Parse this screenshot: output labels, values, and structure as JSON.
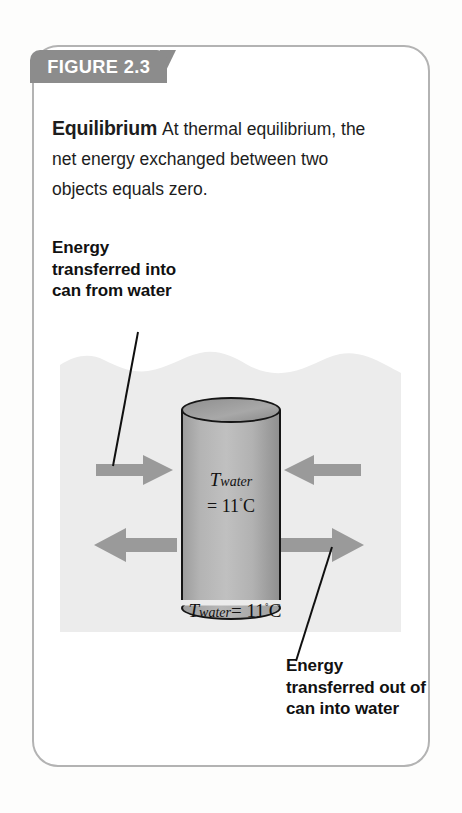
{
  "figure": {
    "tab_label": "FIGURE 2.3",
    "caption_lead": "Equilibrium",
    "caption_body": "At thermal equilibrium, the net energy exchanged between two objects equals zero."
  },
  "callouts": {
    "into_can": "Energy transferred into can from water",
    "out_of_can": "Energy transferred out of can into water"
  },
  "diagram": {
    "can_temperature_symbol": "T",
    "can_temperature_subscript": "water",
    "can_temperature_value": "= 11",
    "degree_symbol": "˚",
    "unit": "C",
    "below_can_label_symbol": "T",
    "below_can_label_subscript": "water",
    "below_can_label_value": "= 11",
    "below_can_label_unit": "C"
  },
  "colors": {
    "tab_gray": "#8c8c8c",
    "card_border": "#b3b3b3",
    "water_gray": "#ececec",
    "arrow_gray": "#9a9a9a",
    "can_gray": "#b4b4b4",
    "outline_black": "#151515"
  }
}
